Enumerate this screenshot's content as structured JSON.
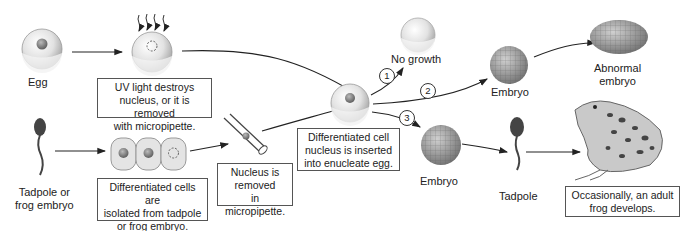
{
  "labels": {
    "egg": "Egg",
    "tadpole_or_frog_embryo": [
      "Tadpole or",
      "frog embryo"
    ],
    "no_growth": "No growth",
    "embryo_upper": "Embryo",
    "embryo_lower": "Embryo",
    "abnormal_embryo": [
      "Abnormal",
      "embryo"
    ],
    "tadpole": "Tadpole"
  },
  "boxes": {
    "uv_light": [
      "UV light destroys",
      "nucleus, or it is removed",
      "with micropipette."
    ],
    "differentiated_isolated": [
      "Differentiated cells are",
      "isolated from tadpole",
      "or frog embryo."
    ],
    "nucleus_removed": [
      "Nucleus is",
      "removed",
      "in micropipette."
    ],
    "nucleus_inserted": [
      "Differentiated cell",
      "nucleus is inserted",
      "into enucleate egg."
    ],
    "adult_frog": [
      "Occasionally, an adult",
      "frog develops."
    ]
  },
  "outcomes": [
    "1",
    "2",
    "3"
  ],
  "colors": {
    "line": "#222222",
    "box_border": "#555555",
    "egg_shell": "#d8d8d8",
    "nucleus": "#8a8a8a",
    "embryo": "#9a9a9a"
  }
}
